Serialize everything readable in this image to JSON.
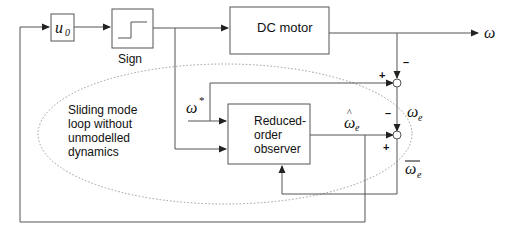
{
  "blocks": {
    "gain": {
      "symbol": "u",
      "subscript": "0"
    },
    "sign": {
      "label": "Sign"
    },
    "motor": {
      "label": "DC motor"
    },
    "observer": {
      "line1": "Reduced-",
      "line2": "order",
      "line3": "observer"
    }
  },
  "signals": {
    "output": "ω",
    "reference": "ω",
    "reference_sup": "*",
    "error": "ω",
    "error_sub": "e",
    "estimate": "ω",
    "estimate_hat": "^",
    "estimate_sub": "e",
    "estimate_error": "ω",
    "estimate_error_sub": "e"
  },
  "junction_signs": {
    "top_minus": "–",
    "top_plus": "+",
    "bottom_minus": "–",
    "bottom_plus": "+"
  },
  "annotation": {
    "line1": "Sliding mode",
    "line2": "loop without",
    "line3": "unmodelled",
    "line4": "dynamics"
  }
}
